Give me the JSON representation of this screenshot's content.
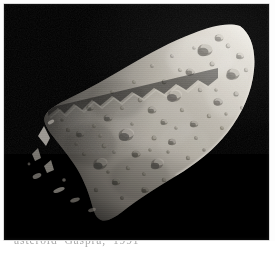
{
  "page": {
    "background_color": "#fdfdfd",
    "kind": "scanned-book-page"
  },
  "photo": {
    "subject": "asteroid-951-gaspra",
    "alt_text": "Black-and-white spacecraft photograph of the asteroid 951 Gaspra, an elongated wedge-shaped cratered body lit from the upper right against black space",
    "background_color": "#000000",
    "body_fill_color": "#a8a49c",
    "highlight_color": "#e8e4dc",
    "terminator_shadow_color": "#1a1a18",
    "frame": {
      "x": 4,
      "y": 4,
      "width": 265,
      "height": 236
    },
    "features": {
      "illumination_direction": "upper-right",
      "limb": "bright rounded limb along upper-right edge",
      "terminator": "shadowed jagged edge along upper-left and left",
      "tip": "narrow pointed end at lower-left",
      "surface": "densely cratered regolith with horizontal raster scan lines",
      "isolated_peaks": "small illuminated ridge fragments beyond the terminator on the left"
    }
  },
  "caption": {
    "text": "asteroid Gaspra, 1991",
    "visibility": "cropped — only the tops of the glyphs are visible at the bottom edge",
    "color": "#9a9a9a"
  }
}
